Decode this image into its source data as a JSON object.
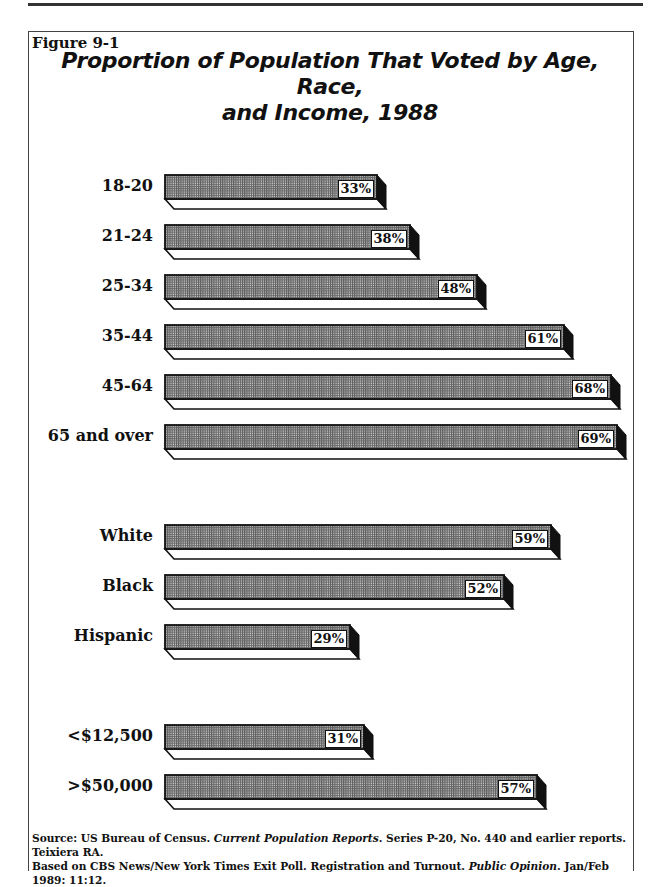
{
  "figure_label": "Figure 9-1",
  "title_line1": "Proportion of Population That Voted by Age, Race,",
  "title_line2": "and Income, 1988",
  "source": {
    "line1_a": "Source: US Bureau of Census. ",
    "line1_b": "Current Population Reports",
    "line1_c": ". Series P-20, No. 440 and earlier reports. Teixiera RA.",
    "line2_a": "Based on CBS News/New York Times Exit Poll. Registration and Turnout. ",
    "line2_b": "Public Opinion",
    "line2_c": ". Jan/Feb 1989: 11:12."
  },
  "colors": {
    "bar_fill": "#9a9a9a",
    "bar_dark": "#111111",
    "bar_base": "#ffffff"
  },
  "chart_data": {
    "type": "bar",
    "orientation": "horizontal",
    "title": "Proportion of Population That Voted by Age, Race, and Income, 1988",
    "xlabel": "",
    "ylabel": "",
    "unit": "%",
    "groups": [
      {
        "name": "Age",
        "categories": [
          "18-20",
          "21-24",
          "25-34",
          "35-44",
          "45-64",
          "65 and over"
        ],
        "values": [
          33,
          38,
          48,
          61,
          68,
          69
        ]
      },
      {
        "name": "Race",
        "categories": [
          "White",
          "Black",
          "Hispanic"
        ],
        "values": [
          59,
          52,
          29
        ]
      },
      {
        "name": "Income",
        "categories": [
          "<$12,500",
          ">$50,000"
        ],
        "values": [
          31,
          57
        ]
      }
    ],
    "categories": [
      "18-20",
      "21-24",
      "25-34",
      "35-44",
      "45-64",
      "65 and over",
      "White",
      "Black",
      "Hispanic",
      "<$12,500",
      ">$50,000"
    ],
    "values": [
      33,
      38,
      48,
      61,
      68,
      69,
      59,
      52,
      29,
      31,
      57
    ],
    "labels": [
      "33%",
      "38%",
      "48%",
      "61%",
      "68%",
      "69%",
      "59%",
      "52%",
      "29%",
      "31%",
      "57%"
    ],
    "grid": false,
    "legend": null
  }
}
